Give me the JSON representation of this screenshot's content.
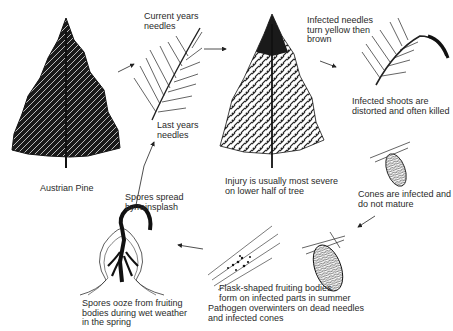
{
  "diagram": {
    "type": "disease-cycle",
    "subject": "Austrian Pine",
    "stages": [
      {
        "id": "host",
        "label": "Austrian Pine"
      },
      {
        "id": "needles-current",
        "label": "Current years\nneedles"
      },
      {
        "id": "needles-last",
        "label": "Last years\nneedles"
      },
      {
        "id": "tree-injury",
        "label": "Injury is usually most severe\non lower half of tree"
      },
      {
        "id": "needles-infected",
        "label": "Infected needles\nturn yellow then\nbrown"
      },
      {
        "id": "shoots",
        "label": "Infected shoots are\ndistorted and often killed"
      },
      {
        "id": "cones",
        "label": "Cones are infected and\ndo not mature"
      },
      {
        "id": "overwinter",
        "label": "Pathogen overwinters on dead needles\nand infected cones"
      },
      {
        "id": "fruiting",
        "label": "Flask-shaped fruiting bodies\nform on infected parts in summer"
      },
      {
        "id": "ooze",
        "label": "Spores ooze from fruiting\nbodies during wet weather\nin the spring"
      },
      {
        "id": "spread",
        "label": "Spores spread\nby rainsplash"
      }
    ],
    "flow": [
      "host",
      "needles-current",
      "tree-injury",
      "needles-infected",
      "cones",
      "overwinter",
      "fruiting",
      "ooze",
      "spread",
      "needles-last"
    ]
  }
}
